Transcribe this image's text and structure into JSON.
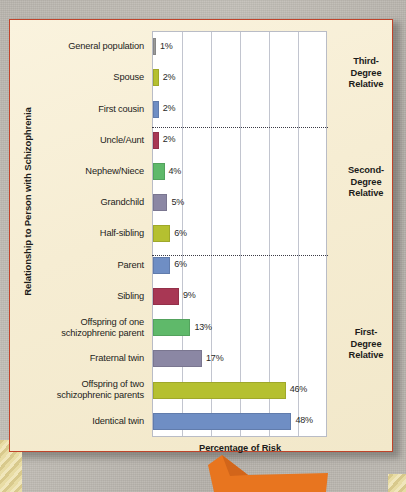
{
  "figure": {
    "y_axis_title": "Relationship to Person with Schizophrenia",
    "x_axis_title": "Percentage of Risk",
    "card_color": "#f6edd4",
    "border_color": "#c0432a",
    "plot_bg": "#ffffff",
    "grid_color": "#c2c5cf",
    "accent_arrow_color": "#e8751f"
  },
  "groups": [
    {
      "name": "third-degree",
      "label": "Third-\nDegree\nRelative",
      "top": 56
    },
    {
      "name": "second-degree",
      "label": "Second-\nDegree\nRelative",
      "top": 165
    },
    {
      "name": "first-degree",
      "label": "First-\nDegree\nRelative",
      "top": 327
    }
  ],
  "separators": [
    127,
    255
  ],
  "chart_data": {
    "type": "bar",
    "orientation": "horizontal",
    "title": "",
    "xlabel": "Percentage of Risk",
    "ylabel": "Relationship to Person with Schizophrenia",
    "xlim": [
      0,
      60
    ],
    "xticks": [
      0,
      10,
      20,
      30,
      40,
      50,
      60
    ],
    "grid": true,
    "legend": false,
    "categories": [
      "General population",
      "Spouse",
      "First cousin",
      "Uncle/Aunt",
      "Nephew/Niece",
      "Grandchild",
      "Half-sibling",
      "Parent",
      "Sibling",
      "Offspring of one\nschizophrenic parent",
      "Fraternal twin",
      "Offspring of two\nschizophrenic parents",
      "Identical twin"
    ],
    "values": [
      1,
      2,
      2,
      2,
      4,
      5,
      6,
      6,
      9,
      13,
      17,
      46,
      48
    ],
    "value_labels": [
      "1%",
      "2%",
      "2%",
      "2%",
      "4%",
      "5%",
      "6%",
      "6%",
      "9%",
      "13%",
      "17%",
      "46%",
      "48%"
    ],
    "colors": [
      "#9a9a9a",
      "#b5c030",
      "#6f8ec4",
      "#a83754",
      "#5fb96a",
      "#8b87a4",
      "#b5c030",
      "#6f8ec4",
      "#a83754",
      "#5fb96a",
      "#8b87a4",
      "#b5c030",
      "#6f8ec4"
    ],
    "group_annotations": [
      "Third-Degree Relative",
      "Second-Degree Relative",
      "First-Degree Relative"
    ]
  }
}
